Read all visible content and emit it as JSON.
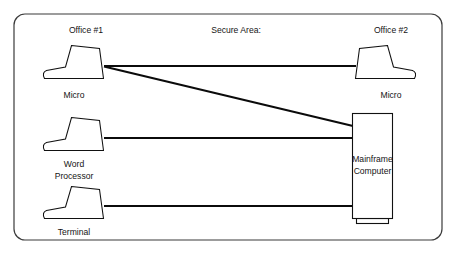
{
  "diagram": {
    "type": "network-topology",
    "title": "",
    "canvas": {
      "width": 456,
      "height": 257,
      "background": "#ffffff"
    },
    "colors": {
      "frame_stroke": "#3b3b3b",
      "device_stroke": "#111111",
      "device_fill": "#ffffff",
      "link_stroke": "#0b0b0b",
      "text": "#151515"
    },
    "frame": {
      "label": "diagram-border",
      "x": 14,
      "y": 14,
      "width": 428,
      "height": 226,
      "radius": 11
    },
    "zones": [
      {
        "id": "office-1",
        "label": "Office #1",
        "x": 86,
        "y": 31
      },
      {
        "id": "secure-area",
        "label": "Secure Area:",
        "x": 236,
        "y": 31
      },
      {
        "id": "office-2",
        "label": "Office #2",
        "x": 391,
        "y": 31
      }
    ],
    "nodes": [
      {
        "id": "office1-micro",
        "label": "Micro",
        "label_lines": [
          "Micro"
        ],
        "kind": "terminal",
        "orientation": "keyboard-left",
        "zone": "office-1",
        "x": 42,
        "y": 45,
        "label_x": 74,
        "label_y": 97,
        "port_x": 103,
        "port_y": 66
      },
      {
        "id": "office1-word-processor",
        "label": "Word Processor",
        "label_lines": [
          "Word",
          "Processor"
        ],
        "kind": "terminal",
        "orientation": "keyboard-left",
        "zone": "office-1",
        "x": 42,
        "y": 117,
        "label_x": 74,
        "label_y": 169,
        "port_x": 103,
        "port_y": 138
      },
      {
        "id": "office1-terminal",
        "label": "Terminal",
        "label_lines": [
          "Terminal"
        ],
        "kind": "terminal",
        "orientation": "keyboard-left",
        "zone": "office-1",
        "x": 42,
        "y": 186,
        "label_x": 74,
        "label_y": 234,
        "port_x": 103,
        "port_y": 206
      },
      {
        "id": "office2-micro",
        "label": "Micro",
        "label_lines": [
          "Micro"
        ],
        "kind": "terminal",
        "orientation": "keyboard-right",
        "zone": "office-2",
        "x": 355,
        "y": 45,
        "label_x": 391,
        "label_y": 97,
        "port_x": 356,
        "port_y": 66
      },
      {
        "id": "mainframe",
        "label": "Mainframe Computer",
        "label_lines": [
          "Mainframe",
          "Computer"
        ],
        "kind": "mainframe",
        "zone": "secure-area",
        "x": 352,
        "y": 113,
        "width": 40,
        "height": 108,
        "label_x": 372,
        "label_y": 164
      }
    ],
    "links": [
      {
        "id": "link-micro-to-micro",
        "from": "office1-micro",
        "to": "office2-micro",
        "style": "horizontal",
        "x1": 104,
        "y1": 66,
        "x2": 356,
        "y2": 66
      },
      {
        "id": "link-micro-to-mainframe",
        "from": "office1-micro",
        "to": "mainframe",
        "style": "diagonal",
        "x1": 104,
        "y1": 66,
        "x2": 352,
        "y2": 126
      },
      {
        "id": "link-wordprocessor-to-mainframe",
        "from": "office1-word-processor",
        "to": "mainframe",
        "style": "horizontal",
        "x1": 104,
        "y1": 138,
        "x2": 352,
        "y2": 138
      },
      {
        "id": "link-terminal-to-mainframe",
        "from": "office1-terminal",
        "to": "mainframe",
        "style": "horizontal",
        "x1": 104,
        "y1": 206,
        "x2": 352,
        "y2": 206
      }
    ]
  }
}
